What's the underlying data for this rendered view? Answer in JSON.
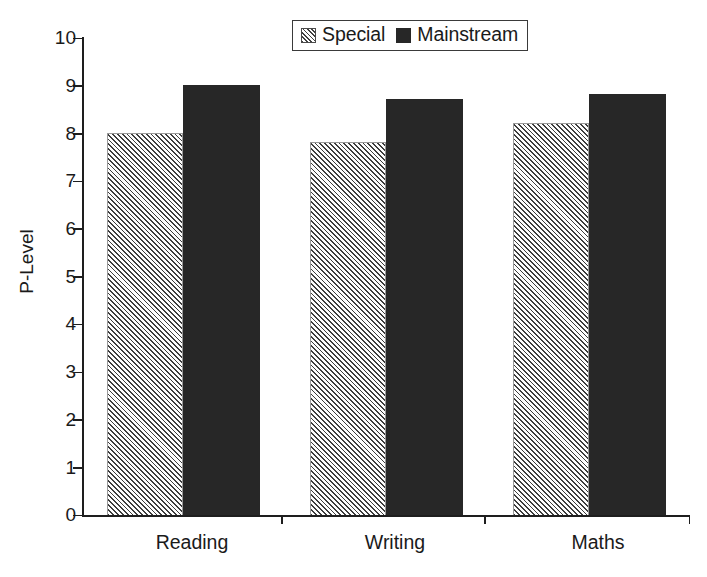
{
  "chart_data": {
    "type": "bar",
    "title": "",
    "xlabel": "",
    "ylabel": "P-Level",
    "ylim": [
      0,
      10
    ],
    "ytick_labels": [
      "10",
      "9",
      "8",
      "7",
      "6",
      "5",
      "4",
      "3",
      "2",
      "1",
      "0"
    ],
    "ytick_values": [
      10,
      9,
      8,
      7,
      6,
      5,
      4,
      3,
      2,
      1,
      0
    ],
    "grid": false,
    "legend_position": "top-center",
    "categories": [
      "Reading",
      "Writing",
      "Maths"
    ],
    "series": [
      {
        "name": "Special",
        "values": [
          8.0,
          7.8,
          8.2
        ],
        "pattern": "diagonal-hatch",
        "color": "#f4f4f4",
        "hatch_color": "#3d3d3d"
      },
      {
        "name": "Mainstream",
        "values": [
          9.0,
          8.7,
          8.8
        ],
        "pattern": "solid",
        "color": "#272727",
        "hatch_color": "#272727"
      }
    ]
  },
  "legend": {
    "entries": [
      {
        "label": "Special",
        "swatch": "hatched-swatch-icon"
      },
      {
        "label": "Mainstream",
        "swatch": "solid-swatch-icon"
      }
    ]
  },
  "axes": {
    "y_title": "P-Level"
  }
}
